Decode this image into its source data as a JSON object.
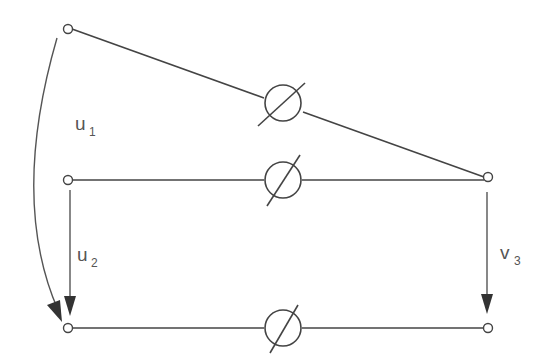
{
  "diagram": {
    "type": "circuit",
    "labels": {
      "u1": {
        "main": "u",
        "sub": "1"
      },
      "u2": {
        "main": "u",
        "sub": "2"
      },
      "v3": {
        "main": "v",
        "sub": "3"
      }
    },
    "elements": [
      {
        "id": "element-top",
        "kind": "variable-element"
      },
      {
        "id": "element-middle",
        "kind": "variable-element"
      },
      {
        "id": "element-bottom",
        "kind": "variable-element"
      }
    ],
    "terminals": [
      "top-left",
      "middle-left",
      "middle-right",
      "bottom-left",
      "bottom-right"
    ],
    "arrows": [
      {
        "id": "u1-arrow",
        "from": "top-left",
        "to": "bottom-left",
        "shape": "curved"
      },
      {
        "id": "u2-arrow",
        "from": "middle-left",
        "to": "bottom-left",
        "shape": "straight"
      },
      {
        "id": "v3-arrow",
        "from": "middle-right",
        "to": "bottom-right",
        "shape": "straight"
      }
    ]
  }
}
